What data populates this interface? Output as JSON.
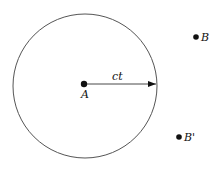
{
  "diagram": {
    "circle": {
      "cx": 85,
      "cy": 86,
      "r": 72,
      "stroke": "#555555"
    },
    "center_point": {
      "label": "A",
      "x": 84,
      "y": 84
    },
    "radius_arrow": {
      "label": "ct",
      "x1": 84,
      "y1": 84,
      "x2": 157,
      "y2": 84
    },
    "points": [
      {
        "label": "B",
        "x": 196,
        "y": 37
      },
      {
        "label": "B'",
        "x": 179,
        "y": 137
      }
    ]
  }
}
